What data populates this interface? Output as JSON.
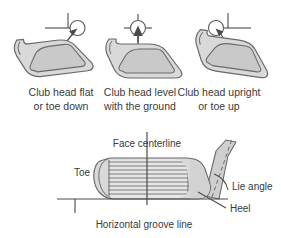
{
  "figure": {
    "title_visible": false,
    "background_color": "#ffffff",
    "line_color": "#4a4a4a",
    "text_color": "#3a3a3a",
    "clubhead_fill": "#d9d9d9",
    "clubhead_inner_fill": "#c9c9c9",
    "shaft_fill": "#cfcfcf"
  },
  "top_row": {
    "panels": [
      {
        "id": "flat",
        "caption_line1": "Club head flat",
        "caption_line2": "or toe down",
        "marker": "circle-with-corner-lines",
        "arrow": "arrow-up-right"
      },
      {
        "id": "level",
        "caption_line1": "Club head level",
        "caption_line2": "with the ground",
        "marker": "circle-with-crosshair",
        "arrow": "arrow-up"
      },
      {
        "id": "upright",
        "caption_line1": "Club head upright",
        "caption_line2": "or toe up",
        "marker": "circle-with-corner-lines",
        "arrow": "arrow-up-left"
      }
    ]
  },
  "bottom_diagram": {
    "labels": {
      "face_centerline": "Face centerline",
      "toe": "Toe",
      "lie_angle": "Lie angle",
      "heel": "Heel",
      "horizontal_groove_line": "Horizontal groove line"
    }
  }
}
